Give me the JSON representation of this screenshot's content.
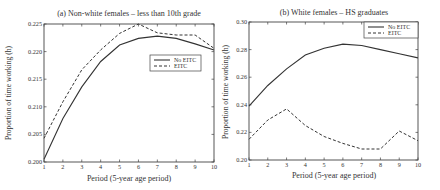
{
  "chart_data": [
    {
      "type": "line",
      "title": "(a) Non-white females – less than 10th grade",
      "xlabel": "Period (5-year age period)",
      "ylabel": "Proportion of time working (h)",
      "x": [
        1,
        2,
        3,
        4,
        5,
        6,
        7,
        8,
        9,
        10
      ],
      "xlim": [
        1,
        10
      ],
      "ylim": [
        0.2,
        0.225
      ],
      "xticks": [
        "1",
        "2",
        "3",
        "4",
        "5",
        "6",
        "7",
        "8",
        "9",
        "10"
      ],
      "yticks": [
        "0.200",
        "0.205",
        "0.210",
        "0.215",
        "0.220",
        "0.225"
      ],
      "legend_position": "center-right",
      "grid": false,
      "series": [
        {
          "name": "No EITC",
          "style": "solid",
          "values": [
            0.2005,
            0.2079,
            0.2136,
            0.2182,
            0.2212,
            0.2224,
            0.2228,
            0.2224,
            0.2214,
            0.2203
          ]
        },
        {
          "name": "EITC",
          "style": "dashed",
          "values": [
            0.2043,
            0.2109,
            0.2167,
            0.2203,
            0.2233,
            0.225,
            0.2234,
            0.223,
            0.223,
            0.2206
          ]
        }
      ]
    },
    {
      "type": "line",
      "title": "(b) White females – HS graduates",
      "xlabel": "Period (5-year age period)",
      "ylabel": "Proportion of time working (h)",
      "x": [
        1,
        2,
        3,
        4,
        5,
        6,
        7,
        8,
        9,
        10
      ],
      "xlim": [
        1,
        10
      ],
      "ylim": [
        0.2,
        0.3
      ],
      "xticks": [
        "1",
        "2",
        "3",
        "4",
        "5",
        "6",
        "7",
        "8",
        "9",
        "10"
      ],
      "yticks": [
        "0.20",
        "0.22",
        "0.24",
        "0.26",
        "0.28",
        "0.30"
      ],
      "legend_position": "upper-right",
      "grid": false,
      "series": [
        {
          "name": "No EITC",
          "style": "solid",
          "values": [
            0.239,
            0.254,
            0.266,
            0.276,
            0.281,
            0.284,
            0.283,
            0.28,
            0.277,
            0.274
          ]
        },
        {
          "name": "EITC",
          "style": "dashed",
          "values": [
            0.215,
            0.229,
            0.237,
            0.225,
            0.217,
            0.212,
            0.208,
            0.208,
            0.221,
            0.214
          ]
        }
      ]
    }
  ]
}
